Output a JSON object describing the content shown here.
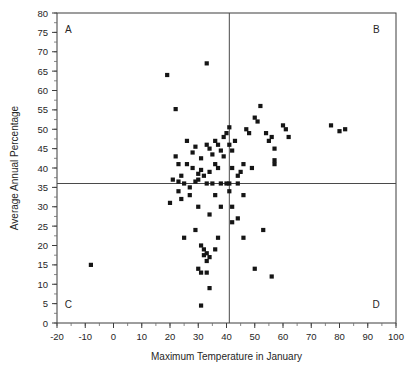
{
  "chart_data": {
    "type": "scatter",
    "title": "",
    "xlabel": "Maximum Temperature in January",
    "ylabel": "Average Annual Percentage",
    "xlim": [
      -20,
      100
    ],
    "ylim": [
      0,
      80
    ],
    "xticks": [
      -20,
      -10,
      0,
      10,
      20,
      30,
      40,
      50,
      60,
      70,
      80,
      90,
      100
    ],
    "yticks": [
      0,
      5,
      10,
      15,
      20,
      25,
      30,
      35,
      40,
      45,
      50,
      55,
      60,
      65,
      70,
      75,
      80
    ],
    "xtick_labels": [
      "-20",
      "-10",
      "0",
      "10",
      "20",
      "30",
      "40",
      "50",
      "60",
      "70",
      "80",
      "90",
      "100"
    ],
    "ytick_labels": [
      "0",
      "5",
      "10",
      "15",
      "20",
      "25",
      "30",
      "35",
      "40",
      "45",
      "50",
      "55",
      "60",
      "65",
      "70",
      "75",
      "80"
    ],
    "x_minor_step": 5,
    "y_minor_step": 2.5,
    "grid": false,
    "legend": null,
    "marker_color": "#151515",
    "marker_shape": "square",
    "reference_lines": [
      {
        "orientation": "vertical",
        "value": 41,
        "color": "#4a4a4a"
      },
      {
        "orientation": "horizontal",
        "value": 36,
        "color": "#4a4a4a"
      }
    ],
    "quadrant_labels": [
      {
        "label": "A",
        "x": -16,
        "y": 76
      },
      {
        "label": "B",
        "x": 93,
        "y": 76
      },
      {
        "label": "C",
        "x": -16,
        "y": 5
      },
      {
        "label": "D",
        "x": 93,
        "y": 5
      }
    ],
    "points": [
      [
        -8,
        15
      ],
      [
        19,
        64
      ],
      [
        22,
        55.2
      ],
      [
        33,
        67
      ],
      [
        22,
        43
      ],
      [
        23,
        41
      ],
      [
        31,
        42.5
      ],
      [
        30,
        38.5
      ],
      [
        23,
        36.5
      ],
      [
        30,
        37
      ],
      [
        26,
        47
      ],
      [
        28,
        44
      ],
      [
        29,
        45.5
      ],
      [
        33,
        46
      ],
      [
        34,
        45
      ],
      [
        36,
        47
      ],
      [
        38,
        44.5
      ],
      [
        39,
        48
      ],
      [
        40,
        49
      ],
      [
        41,
        50.5
      ],
      [
        41,
        46
      ],
      [
        42,
        44.5
      ],
      [
        43,
        47
      ],
      [
        36,
        41
      ],
      [
        37,
        40
      ],
      [
        34,
        39
      ],
      [
        32,
        38
      ],
      [
        31,
        39.5
      ],
      [
        28,
        40
      ],
      [
        26,
        41
      ],
      [
        24,
        38
      ],
      [
        21,
        37
      ],
      [
        25,
        36
      ],
      [
        27,
        35
      ],
      [
        29,
        36.5
      ],
      [
        33,
        36
      ],
      [
        35,
        36
      ],
      [
        38,
        36
      ],
      [
        40,
        36
      ],
      [
        41,
        36
      ],
      [
        41,
        34
      ],
      [
        44,
        36
      ],
      [
        44,
        38
      ],
      [
        45,
        39
      ],
      [
        46,
        41
      ],
      [
        47,
        50
      ],
      [
        48,
        49
      ],
      [
        50,
        53
      ],
      [
        51,
        52
      ],
      [
        52,
        56
      ],
      [
        54,
        49
      ],
      [
        55,
        47
      ],
      [
        56,
        48
      ],
      [
        57,
        45
      ],
      [
        57,
        42
      ],
      [
        57,
        41
      ],
      [
        60,
        51
      ],
      [
        61,
        50
      ],
      [
        62,
        48
      ],
      [
        77,
        51
      ],
      [
        80,
        49.5
      ],
      [
        82,
        50
      ],
      [
        20,
        31
      ],
      [
        24,
        32
      ],
      [
        27,
        33
      ],
      [
        30,
        30
      ],
      [
        34,
        28
      ],
      [
        25,
        22
      ],
      [
        29,
        24
      ],
      [
        31,
        20
      ],
      [
        32,
        19
      ],
      [
        32,
        17.5
      ],
      [
        33,
        18
      ],
      [
        33,
        16
      ],
      [
        34,
        17
      ],
      [
        30,
        14
      ],
      [
        31,
        13
      ],
      [
        33,
        13
      ],
      [
        36,
        19
      ],
      [
        37,
        22
      ],
      [
        34,
        9
      ],
      [
        31,
        4.5
      ],
      [
        42,
        30
      ],
      [
        44,
        27
      ],
      [
        46,
        22
      ],
      [
        50,
        14
      ],
      [
        53,
        24
      ],
      [
        56,
        12
      ],
      [
        49,
        40
      ],
      [
        42,
        26
      ],
      [
        23,
        34
      ],
      [
        36,
        33
      ],
      [
        38,
        30
      ],
      [
        46,
        33
      ],
      [
        39,
        43
      ],
      [
        35,
        43.5
      ],
      [
        37,
        46
      ],
      [
        42,
        40
      ]
    ]
  }
}
